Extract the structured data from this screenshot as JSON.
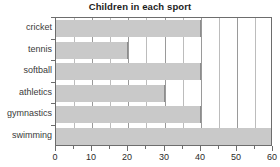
{
  "chart_data": {
    "type": "bar",
    "orientation": "horizontal",
    "title": "Children in each sport",
    "xlabel": "",
    "ylabel": "",
    "categories": [
      "cricket",
      "tennis",
      "softball",
      "athletics",
      "gymnastics",
      "swimming"
    ],
    "values": [
      40,
      20,
      40,
      30,
      40,
      60
    ],
    "xlim": [
      0,
      60
    ],
    "xticks": [
      0,
      10,
      20,
      30,
      40,
      50,
      60
    ],
    "xtick_labels": [
      "0",
      "10",
      "20",
      "30",
      "40",
      "50",
      "60"
    ],
    "minor_xticks": [
      5,
      15,
      25,
      35,
      45,
      55
    ],
    "grid": true,
    "grid_axis": "x",
    "legend": false,
    "colors": {
      "bar_fill": "#c9c9c9",
      "bar_edge": "#8d8d8d",
      "gridline": "#9a9a9a",
      "gridline_minor": "#bcbcbc",
      "axis": "#6d6d6d",
      "title_text": "#1c1c1c",
      "tick_text": "#2b2b2b",
      "category_text": "#3a3a3a",
      "background": "#ffffff"
    }
  }
}
